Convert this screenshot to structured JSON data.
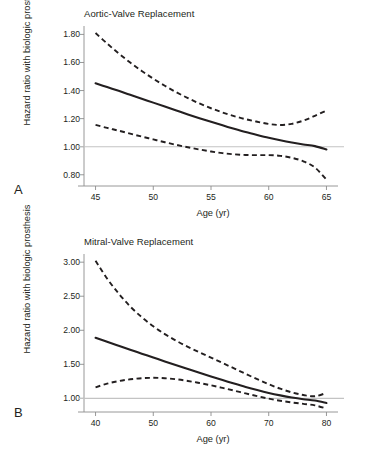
{
  "figure": {
    "ylabel": "Hazard ratio with biologic prosthesis",
    "xlabel": "Age (yr)",
    "reference_line_value": 1.0,
    "colors": {
      "curve": "#231f20",
      "reference": "#bcbcbc",
      "axis": "#8c8c8c",
      "text": "#231f20",
      "background": "#ffffff"
    }
  },
  "panels": [
    {
      "letter": "A",
      "title": "Aortic-Valve Replacement",
      "xlabel": "Age (yr)",
      "ylabel": "Hazard ratio with biologic prosthesis"
    },
    {
      "letter": "B",
      "title": "Mitral-Valve Replacement",
      "xlabel": "Age (yr)",
      "ylabel": "Hazard ratio with biologic prosthesis"
    }
  ],
  "chart_data": [
    {
      "type": "line",
      "panel": "A",
      "title": "Aortic-Valve Replacement",
      "xlabel": "Age (yr)",
      "ylabel": "Hazard ratio with biologic prosthesis",
      "xlim": [
        44,
        66
      ],
      "ylim": [
        0.72,
        1.86
      ],
      "xticks": [
        45,
        50,
        55,
        60,
        65
      ],
      "xtick_labels": [
        "45",
        "50",
        "55",
        "60",
        "65"
      ],
      "yticks": [
        0.8,
        1.0,
        1.2,
        1.4,
        1.6,
        1.8
      ],
      "ytick_labels": [
        "0.80",
        "1.00",
        "1.20",
        "1.40",
        "1.60",
        "1.80"
      ],
      "grid": false,
      "legend": "none",
      "reference_line": 1.0,
      "x": [
        45,
        46,
        47,
        48,
        49,
        50,
        51,
        52,
        53,
        54,
        55,
        56,
        57,
        58,
        59,
        60,
        61,
        62,
        63,
        64,
        65
      ],
      "series": [
        {
          "name": "Hazard ratio",
          "style": "solid",
          "values": [
            1.452,
            1.425,
            1.398,
            1.37,
            1.342,
            1.314,
            1.286,
            1.258,
            1.23,
            1.203,
            1.177,
            1.152,
            1.128,
            1.105,
            1.084,
            1.064,
            1.046,
            1.03,
            1.016,
            1.004,
            0.98
          ]
        },
        {
          "name": "Upper 95% CI",
          "style": "dashed",
          "values": [
            1.81,
            1.735,
            1.665,
            1.6,
            1.54,
            1.485,
            1.434,
            1.388,
            1.346,
            1.308,
            1.274,
            1.244,
            1.218,
            1.196,
            1.178,
            1.162,
            1.155,
            1.163,
            1.186,
            1.22,
            1.258
          ]
        },
        {
          "name": "Lower 95% CI",
          "style": "dashed",
          "values": [
            1.155,
            1.134,
            1.114,
            1.093,
            1.072,
            1.052,
            1.032,
            1.013,
            0.996,
            0.98,
            0.966,
            0.954,
            0.946,
            0.941,
            0.94,
            0.94,
            0.935,
            0.921,
            0.896,
            0.852,
            0.765
          ]
        }
      ],
      "annotations": [
        "Hazard ratio curve crosses 1.00 near age 63",
        "Lower confidence bound crosses 1.00 near age 52.5",
        "Upper confidence bound reaches a minimum of about 1.15 near age 60"
      ]
    },
    {
      "type": "line",
      "panel": "B",
      "title": "Mitral-Valve Replacement",
      "xlabel": "Age (yr)",
      "ylabel": "Hazard ratio with biologic prosthesis",
      "xlim": [
        38,
        82
      ],
      "ylim": [
        0.8,
        3.12
      ],
      "xticks": [
        40,
        50,
        60,
        70,
        80
      ],
      "xtick_labels": [
        "40",
        "50",
        "60",
        "70",
        "80"
      ],
      "yticks": [
        1.0,
        1.5,
        2.0,
        2.5,
        3.0
      ],
      "ytick_labels": [
        "1.00",
        "1.50",
        "2.00",
        "2.50",
        "3.00"
      ],
      "grid": false,
      "legend": "none",
      "reference_line": 1.0,
      "x": [
        40,
        42,
        44,
        46,
        48,
        50,
        52,
        54,
        56,
        58,
        60,
        62,
        64,
        66,
        68,
        70,
        72,
        74,
        76,
        78,
        80
      ],
      "series": [
        {
          "name": "Hazard ratio",
          "style": "solid",
          "values": [
            1.89,
            1.83,
            1.772,
            1.714,
            1.657,
            1.6,
            1.543,
            1.487,
            1.432,
            1.377,
            1.323,
            1.27,
            1.218,
            1.168,
            1.122,
            1.08,
            1.044,
            1.013,
            0.988,
            0.968,
            0.932
          ]
        },
        {
          "name": "Upper 95% CI",
          "style": "dashed",
          "values": [
            3.02,
            2.76,
            2.54,
            2.35,
            2.192,
            2.058,
            1.944,
            1.845,
            1.757,
            1.676,
            1.598,
            1.52,
            1.44,
            1.36,
            1.282,
            1.208,
            1.142,
            1.088,
            1.05,
            1.032,
            1.08
          ]
        },
        {
          "name": "Lower 95% CI",
          "style": "dashed",
          "values": [
            1.162,
            1.216,
            1.254,
            1.28,
            1.296,
            1.302,
            1.296,
            1.28,
            1.256,
            1.226,
            1.192,
            1.154,
            1.114,
            1.073,
            1.033,
            0.996,
            0.965,
            0.94,
            0.92,
            0.898,
            0.85
          ]
        }
      ],
      "annotations": [
        "Hazard ratio curve crosses 1.00 near age 75",
        "Lower confidence bound crosses 1.00 near age 70",
        "Lower confidence bound peaks at about 1.30 near age 50",
        "Upper confidence bound reaches a minimum of about 1.03 near age 77"
      ]
    }
  ]
}
